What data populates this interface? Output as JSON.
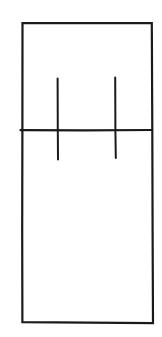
{
  "diagram": {
    "title": "",
    "stroke_color": "#1a1a1a",
    "background_color": "#ffffff",
    "elements": [
      {
        "name": "outer-rectangle",
        "kind": "rectangle"
      },
      {
        "name": "horizontal-divider-line",
        "kind": "line"
      },
      {
        "name": "left-vertical-tick",
        "kind": "line"
      },
      {
        "name": "right-vertical-tick",
        "kind": "line"
      }
    ],
    "labels": []
  }
}
